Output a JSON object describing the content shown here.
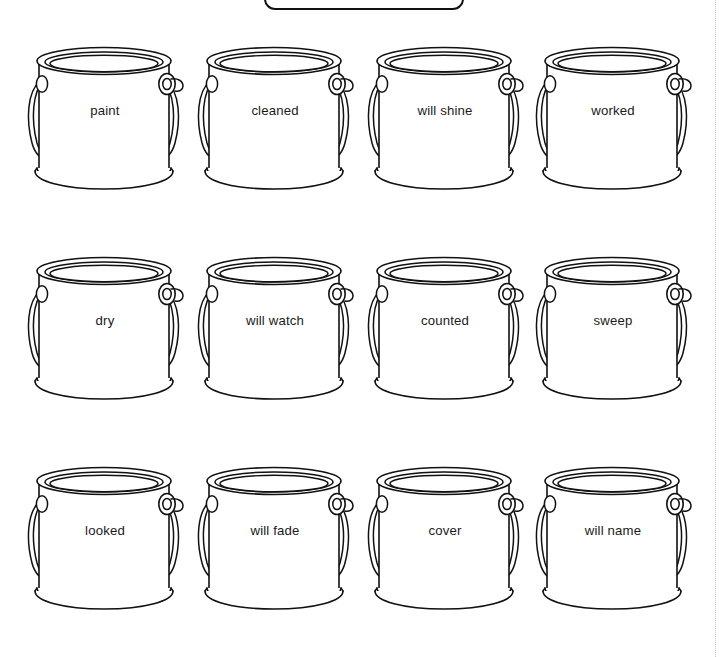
{
  "page": {
    "background_color": "#ffffff",
    "ink_color": "#111111",
    "text_color": "#1a1a1a",
    "guide_color": "#c9c9c9"
  },
  "header_banner": {
    "shape": "rounded-rectangle",
    "label": "",
    "clipped": "top"
  },
  "grid": {
    "columns": 4,
    "rows": 3,
    "cans": [
      {
        "id": "can-1",
        "row": 1,
        "col": 1,
        "label": "paint"
      },
      {
        "id": "can-2",
        "row": 1,
        "col": 2,
        "label": "cleaned"
      },
      {
        "id": "can-3",
        "row": 1,
        "col": 3,
        "label": "will shine"
      },
      {
        "id": "can-4",
        "row": 1,
        "col": 4,
        "label": "worked"
      },
      {
        "id": "can-5",
        "row": 2,
        "col": 1,
        "label": "dry"
      },
      {
        "id": "can-6",
        "row": 2,
        "col": 2,
        "label": "will watch"
      },
      {
        "id": "can-7",
        "row": 2,
        "col": 3,
        "label": "counted"
      },
      {
        "id": "can-8",
        "row": 2,
        "col": 4,
        "label": "sweep"
      },
      {
        "id": "can-9",
        "row": 3,
        "col": 1,
        "label": "looked"
      },
      {
        "id": "can-10",
        "row": 3,
        "col": 2,
        "label": "will fade"
      },
      {
        "id": "can-11",
        "row": 3,
        "col": 3,
        "label": "cover"
      },
      {
        "id": "can-12",
        "row": 3,
        "col": 4,
        "label": "will name"
      }
    ]
  }
}
